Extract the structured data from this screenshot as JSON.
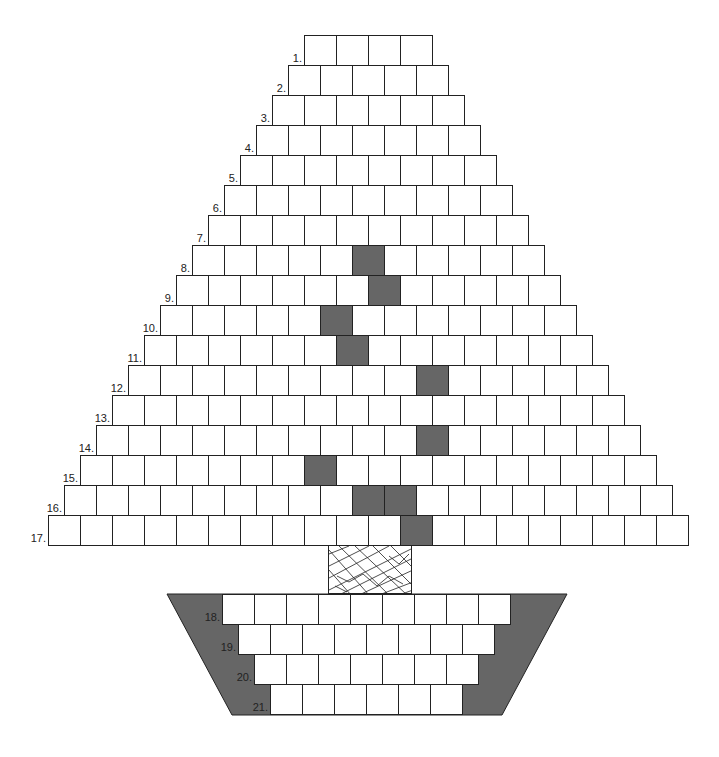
{
  "puzzle": {
    "cell_size": 32,
    "row_height": 30,
    "colors": {
      "cell": "#ffffff",
      "shaded": "#666666",
      "line": "#222222",
      "pot": "#666666"
    },
    "tree_rows": [
      {
        "label": "1.",
        "left": 304,
        "top": 35,
        "cells": 4,
        "shaded": []
      },
      {
        "label": "2.",
        "left": 288,
        "top": 65,
        "cells": 5,
        "shaded": []
      },
      {
        "label": "3.",
        "left": 272,
        "top": 95,
        "cells": 6,
        "shaded": []
      },
      {
        "label": "4.",
        "left": 256,
        "top": 125,
        "cells": 7,
        "shaded": []
      },
      {
        "label": "5.",
        "left": 240,
        "top": 155,
        "cells": 8,
        "shaded": []
      },
      {
        "label": "6.",
        "left": 224,
        "top": 185,
        "cells": 9,
        "shaded": []
      },
      {
        "label": "7.",
        "left": 208,
        "top": 215,
        "cells": 10,
        "shaded": []
      },
      {
        "label": "8.",
        "left": 192,
        "top": 245,
        "cells": 11,
        "shaded": [
          5
        ]
      },
      {
        "label": "9.",
        "left": 176,
        "top": 275,
        "cells": 12,
        "shaded": [
          6
        ]
      },
      {
        "label": "10.",
        "left": 160,
        "top": 305,
        "cells": 13,
        "shaded": [
          5
        ]
      },
      {
        "label": "11.",
        "left": 144,
        "top": 335,
        "cells": 14,
        "shaded": [
          6
        ]
      },
      {
        "label": "12.",
        "left": 128,
        "top": 365,
        "cells": 15,
        "shaded": [
          9
        ]
      },
      {
        "label": "13.",
        "left": 112,
        "top": 395,
        "cells": 16,
        "shaded": []
      },
      {
        "label": "14.",
        "left": 96,
        "top": 425,
        "cells": 17,
        "shaded": [
          10
        ]
      },
      {
        "label": "15.",
        "left": 80,
        "top": 455,
        "cells": 18,
        "shaded": [
          7
        ]
      },
      {
        "label": "16.",
        "left": 64,
        "top": 485,
        "cells": 19,
        "shaded": [
          9,
          10
        ]
      },
      {
        "label": "17.",
        "left": 48,
        "top": 515,
        "cells": 20,
        "shaded": [
          11
        ]
      }
    ],
    "pot_rows": [
      {
        "label": "18.",
        "left": 222,
        "top": 594,
        "cells": 9,
        "shaded": []
      },
      {
        "label": "19.",
        "left": 238,
        "top": 624,
        "cells": 8,
        "shaded": []
      },
      {
        "label": "20.",
        "left": 254,
        "top": 654,
        "cells": 7,
        "shaded": []
      },
      {
        "label": "21.",
        "left": 270,
        "top": 684,
        "cells": 6,
        "shaded": []
      }
    ],
    "pot_shape": {
      "top_left": [
        167,
        594
      ],
      "top_right": [
        567,
        594
      ],
      "bottom_right": [
        502,
        715
      ],
      "bottom_left": [
        232,
        715
      ]
    },
    "trunk": {
      "left": 328,
      "top": 545,
      "width": 84,
      "height": 49
    }
  }
}
